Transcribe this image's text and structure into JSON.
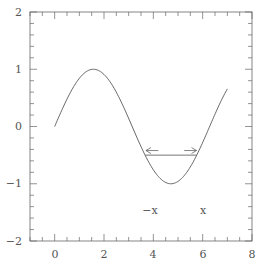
{
  "chart_data": {
    "type": "line",
    "title": "",
    "xlabel": "",
    "ylabel": "",
    "xlim": [
      -1,
      8
    ],
    "ylim": [
      -2,
      2
    ],
    "grid": false,
    "x_ticks": [
      0,
      2,
      4,
      6,
      8
    ],
    "x_tick_labels": [
      "0",
      "2",
      "4",
      "6",
      "8"
    ],
    "y_ticks": [
      -2,
      -1,
      0,
      1,
      2
    ],
    "y_tick_labels": [
      "−2",
      "−1",
      "0",
      "1",
      "2"
    ],
    "series": [
      {
        "name": "sin(x)",
        "function": "sin(x)",
        "x_range": [
          0,
          7
        ],
        "color": "#555555"
      }
    ],
    "annotations": [
      {
        "type": "hline",
        "y": -0.5,
        "x_from": 3.665,
        "x_to": 5.76
      },
      {
        "type": "arrow",
        "direction": "left",
        "x_from": 4.2,
        "x_to": 3.7,
        "y": -0.42
      },
      {
        "type": "arrow",
        "direction": "right",
        "x_from": 5.25,
        "x_to": 5.75,
        "y": -0.42
      },
      {
        "type": "text",
        "text": "−x",
        "x": 3.95,
        "y": -1.05
      },
      {
        "type": "text",
        "text": "x",
        "x": 5.95,
        "y": -1.05
      }
    ]
  },
  "labels": {
    "minus_x": "−x",
    "x": "x",
    "xt0": "0",
    "xt2": "2",
    "xt4": "4",
    "xt6": "6",
    "xt8": "8",
    "yt2": "2",
    "yt1": "1",
    "yt0": "0",
    "ytm1": "−1",
    "ytm2": "−2"
  }
}
